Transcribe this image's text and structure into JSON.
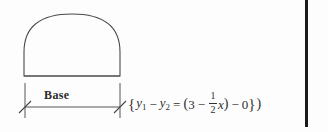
{
  "figure": {
    "shape_name": "dome-arch-region",
    "base_label": "Base",
    "stroke_color": "#4a4a4a",
    "dimension_line_color": "#555555"
  },
  "equation": {
    "open_brace": "{",
    "y1": "y",
    "y1_sub": "1",
    "minus_1": "−",
    "y2": "y",
    "y2_sub": "2",
    "equals": "=",
    "open_paren": "(",
    "three": "3",
    "minus_2": "−",
    "frac_num": "1",
    "frac_den": "2",
    "x_var": "x",
    "close_paren": ")",
    "minus_3": "−",
    "zero": "0",
    "close_brace": "}",
    "trailing_paren": ")",
    "plain_text": "{y₁ − y₂ = (3 − 1/2 x) − 0})"
  },
  "page": {
    "background_color": "#fdfdfd",
    "edge_rule_color": "#1a1a1a",
    "width": 328,
    "height": 132
  }
}
